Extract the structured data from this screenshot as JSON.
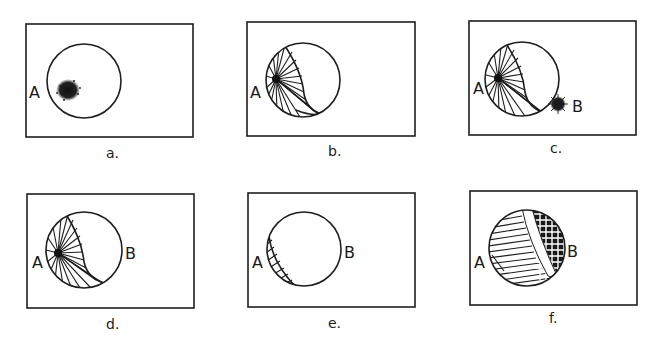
{
  "figure": {
    "panels": [
      {
        "id": "a",
        "caption": "a.",
        "labels": {
          "A": "A"
        },
        "state": "dense spot near A inside circle"
      },
      {
        "id": "b",
        "caption": "b.",
        "labels": {
          "A": "A"
        },
        "state": "radiating hatched crescent from A covering left part of circle"
      },
      {
        "id": "c",
        "caption": "c.",
        "labels": {
          "A": "A",
          "B": "B"
        },
        "state": "radiating hatched crescent from A plus dense spot at B on circle edge"
      },
      {
        "id": "d",
        "caption": "d.",
        "labels": {
          "A": "A",
          "B": "B"
        },
        "state": "radiating hatched crescent from A, B outside circle"
      },
      {
        "id": "e",
        "caption": "e.",
        "labels": {
          "A": "A",
          "B": "B"
        },
        "state": "thin hatched sliver near A"
      },
      {
        "id": "f",
        "caption": "f.",
        "labels": {
          "A": "A",
          "B": "B"
        },
        "state": "circle fully filled: striped region near A, grid region near B, separated by blank band"
      }
    ],
    "colors": {
      "ink": "#1e1e1e",
      "background": "#ffffff"
    }
  }
}
